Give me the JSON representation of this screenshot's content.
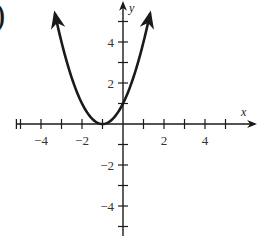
{
  "label_fragment": ")",
  "colors": {
    "ink": "#1a1a1a",
    "background": "#ffffff"
  },
  "chart_data": {
    "type": "line",
    "title": "",
    "function": "y = (x + 1)^2",
    "xlabel": "x",
    "ylabel": "y",
    "xlim": [
      -5,
      6
    ],
    "ylim": [
      -5.5,
      6
    ],
    "x_ticks": [
      -5,
      -4,
      -3,
      -2,
      -1,
      1,
      2,
      3,
      4,
      5
    ],
    "x_tick_labels": [
      {
        "value": -4,
        "text": "−4"
      },
      {
        "value": -2,
        "text": "−2"
      },
      {
        "value": 2,
        "text": "2"
      },
      {
        "value": 4,
        "text": "4"
      }
    ],
    "y_ticks": [
      -5,
      -4,
      -3,
      -2,
      -1,
      1,
      2,
      3,
      4,
      5
    ],
    "y_tick_labels": [
      {
        "value": 4,
        "text": "4"
      },
      {
        "value": 2,
        "text": "2"
      },
      {
        "value": -2,
        "text": "−2"
      },
      {
        "value": -4,
        "text": "−4"
      }
    ],
    "series": [
      {
        "name": "parabola",
        "x": [
          -3.2,
          -3,
          -2.5,
          -2,
          -1.5,
          -1,
          -0.5,
          0,
          0.5,
          1,
          1.5,
          1.7
        ],
        "y": [
          4.84,
          4,
          2.25,
          1,
          0.25,
          0,
          0.25,
          1,
          2.25,
          4,
          6.25,
          7.29
        ]
      }
    ],
    "vertex": [
      -1,
      0
    ],
    "y_intercept": 1,
    "grid": false,
    "legend": null
  }
}
